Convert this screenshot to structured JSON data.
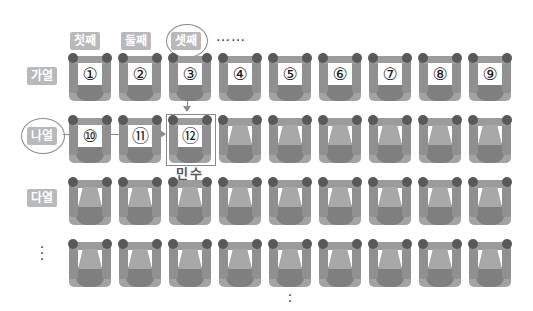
{
  "column_labels": [
    "첫째",
    "둘째",
    "셋째"
  ],
  "column_ellipsis": "……",
  "row_labels": [
    "가열",
    "나열",
    "다열"
  ],
  "row_ellipsis": "⋮",
  "bottom_ellipsis": "⋮",
  "highlighted": {
    "column": "셋째",
    "row": "나열",
    "seat": "⑫",
    "person_name": "민수"
  },
  "seats": {
    "row_ga": [
      "①",
      "②",
      "③",
      "④",
      "⑤",
      "⑥",
      "⑦",
      "⑧",
      "⑨"
    ],
    "row_na": [
      "⑩",
      "⑪",
      "⑫",
      "",
      "",
      "",
      "",
      "",
      ""
    ],
    "row_da": [
      "",
      "",
      "",
      "",
      "",
      "",
      "",
      "",
      ""
    ],
    "row_4": [
      "",
      "",
      "",
      "",
      "",
      "",
      "",
      "",
      ""
    ]
  },
  "colors": {
    "label_bg": "#b9b9b9",
    "seat_dark": "#595959",
    "seat_mid": "#909090",
    "outline": "#8a8a8a"
  }
}
